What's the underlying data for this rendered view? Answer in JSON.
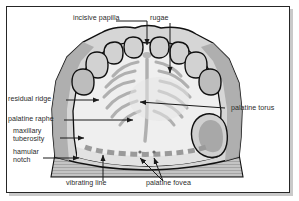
{
  "figure": {
    "frame_color": "#262626",
    "background_color": "#ffffff",
    "outline_color": "#111111",
    "tissue_fill": "#efefef",
    "shade_mid": "#b3b3b3",
    "shade_dark": "#9a9a9a",
    "rugae_color": "#b0b0b0",
    "base_color": "#bdbdbd",
    "leader_color": "#1a1a1a",
    "label_color": "#2b2b2b"
  },
  "labels": {
    "incisive_papilla": "incisive papilla",
    "rugae": "rugae",
    "residual_ridge": "residual ridge",
    "palatine_raphe": "palatine raphe",
    "maxillary_tuberosity_line1": "maxillary",
    "maxillary_tuberosity_line2": "tuberosity",
    "hamular_notch_line1": "hamular",
    "hamular_notch_line2": "notch",
    "palatine_torus": "palatine torus",
    "vibrating_line": "vibrating line",
    "palatine_fovea": "palatine fovea"
  }
}
